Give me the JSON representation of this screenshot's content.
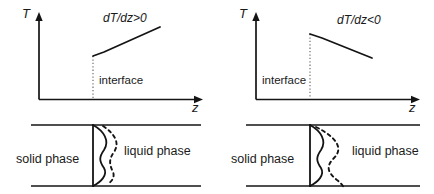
{
  "figure": {
    "background_color": "#ffffff",
    "line_color": "#141414",
    "dotted_color": "#6e6e6e"
  },
  "panels": [
    {
      "id": "left",
      "axes": {
        "y_label": "T",
        "x_label": "z"
      },
      "gradient_label": "dT/dz>0",
      "gradient_sign": "positive",
      "interface_label": "interface",
      "interface_label_side": "right",
      "phases": {
        "solid_label": "solid phase",
        "liquid_label": "liquid phase"
      },
      "curves": {
        "solid_profile": "morphology-perturbation-solid",
        "dashed_profile": "morphology-perturbation-dashed"
      }
    },
    {
      "id": "right",
      "axes": {
        "y_label": "T",
        "x_label": "z"
      },
      "gradient_label": "dT/dz<0",
      "gradient_sign": "negative",
      "interface_label": "interface",
      "interface_label_side": "left",
      "phases": {
        "solid_label": "solid phase",
        "liquid_label": "liquid phase"
      },
      "curves": {
        "solid_profile": "morphology-perturbation-solid",
        "dashed_profile": "morphology-perturbation-dashed-wide"
      }
    }
  ]
}
